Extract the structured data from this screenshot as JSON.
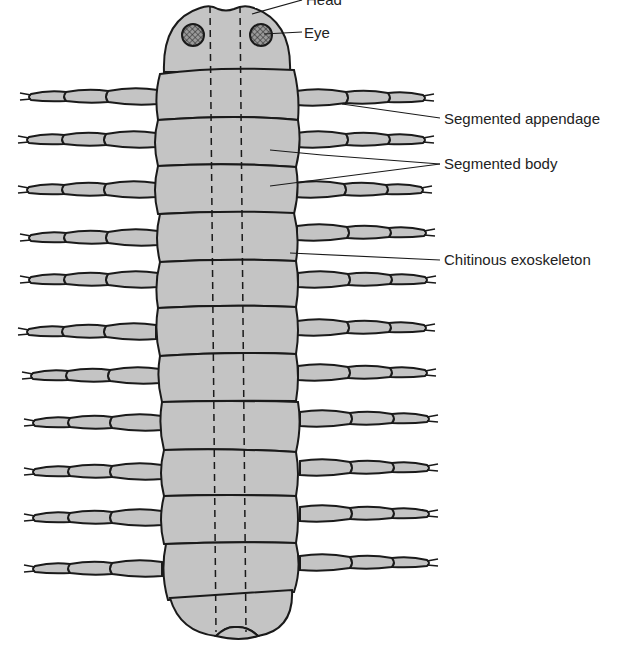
{
  "figure": {
    "colors": {
      "body_fill": "#c4c4c4",
      "outline": "#1a1a1a",
      "eye_fill": "#8a8a8a",
      "background": "#ffffff"
    }
  },
  "labels": {
    "head": "Head",
    "eye": "Eye",
    "segmented_appendage": "Segmented appendage",
    "segmented_body": "Segmented body",
    "chitinous_exoskeleton": "Chitinous exoskeleton"
  },
  "structure": {
    "body_segments": 11,
    "legs_per_side": 11,
    "leg_segments": 3
  }
}
